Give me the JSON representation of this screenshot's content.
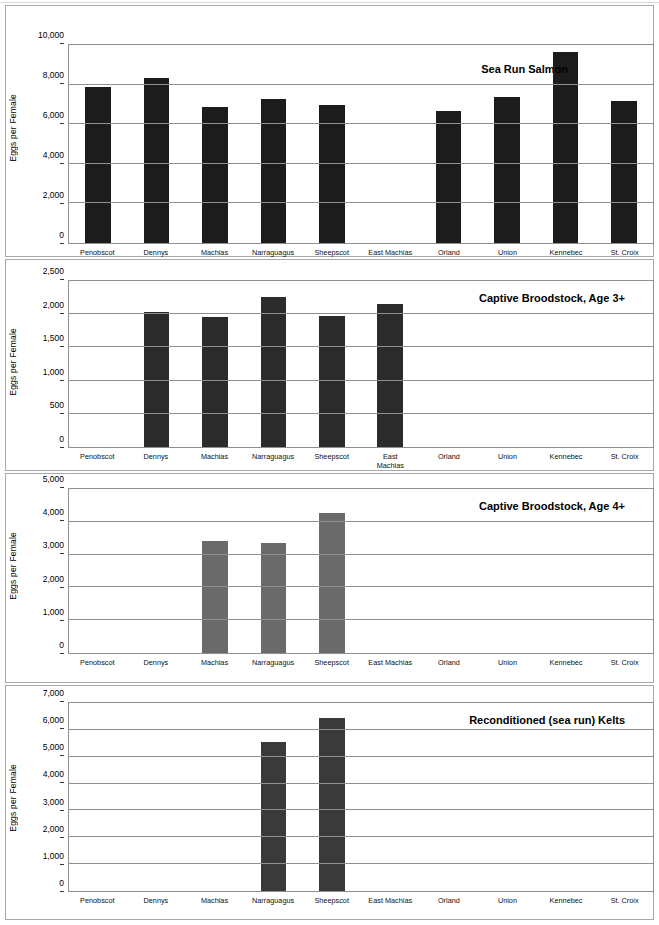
{
  "figure": {
    "title_line1": "Figure 11. Number of eggs per female Atlantic salmon",
    "title_line2": "from Maine rivers by egg source."
  },
  "axis": {
    "ylabel": "Eggs per Female"
  },
  "colors": {
    "bar_sea_run": "#1c1c1c",
    "bar_age3": "#2b2b2b",
    "bar_age4": "#6a6a6a",
    "bar_kelts": "#3a3a3a",
    "gridline": "#8f8f8f",
    "panel_border": "#a8a8a8"
  },
  "chart_data": [
    {
      "type": "bar",
      "title": "Sea Run Salmon",
      "xlabel": "",
      "ylabel": "Eggs per Female",
      "ylim": [
        0,
        10000
      ],
      "yticks": [
        0,
        2000,
        4000,
        6000,
        8000,
        10000
      ],
      "ytick_labels": [
        "0",
        "2,000",
        "4,000",
        "6,000",
        "8,000",
        "10,000"
      ],
      "grid": true,
      "legend": "none",
      "categories": [
        "Penobscot",
        "Dennys",
        "Machias",
        "Narraguagus",
        "Sheepscot",
        "East Machias",
        "Orland",
        "Union",
        "Kennebec",
        "St. Croix"
      ],
      "values": [
        7900,
        8350,
        6880,
        7250,
        6950,
        0,
        6650,
        7380,
        9640,
        7150
      ]
    },
    {
      "type": "bar",
      "title": "Captive Broodstock, Age 3+",
      "xlabel": "",
      "ylabel": "Eggs per Female",
      "ylim": [
        0,
        2500
      ],
      "yticks": [
        0,
        500,
        1000,
        1500,
        2000,
        2500
      ],
      "ytick_labels": [
        "0",
        "500",
        "1,000",
        "1,500",
        "2,000",
        "2,500"
      ],
      "grid": true,
      "legend": "none",
      "categories": [
        "Penobscot",
        "Dennys",
        "Machias",
        "Narraguagus",
        "Sheepscot",
        "East\nMachias",
        "Orland",
        "Union",
        "Kennebec",
        "St. Croix"
      ],
      "values": [
        0,
        2040,
        1965,
        2265,
        1980,
        2155,
        0,
        0,
        0,
        0
      ]
    },
    {
      "type": "bar",
      "title": "Captive Broodstock, Age 4+",
      "xlabel": "",
      "ylabel": "Eggs per Female",
      "ylim": [
        0,
        5000
      ],
      "yticks": [
        0,
        1000,
        2000,
        3000,
        4000,
        5000
      ],
      "ytick_labels": [
        "0",
        "1,000",
        "2,000",
        "3,000",
        "4,000",
        "5,000"
      ],
      "grid": true,
      "legend": "none",
      "categories": [
        "Penobscot",
        "Dennys",
        "Machias",
        "Narraguagus",
        "Sheepscot",
        "East Machias",
        "Orland",
        "Union",
        "Kennebec",
        "St. Croix"
      ],
      "values": [
        0,
        0,
        3420,
        3350,
        4280,
        0,
        0,
        0,
        0,
        0
      ]
    },
    {
      "type": "bar",
      "title": "Reconditioned (sea run) Kelts",
      "xlabel": "",
      "ylabel": "Eggs per Female",
      "ylim": [
        0,
        7000
      ],
      "yticks": [
        0,
        1000,
        2000,
        3000,
        4000,
        5000,
        6000,
        7000
      ],
      "ytick_labels": [
        "0",
        "1,000",
        "2,000",
        "3,000",
        "4,000",
        "5,000",
        "6,000",
        "7,000"
      ],
      "grid": true,
      "legend": "none",
      "categories": [
        "Penobscot",
        "Dennys",
        "Machias",
        "Narraguagus",
        "Sheepscot",
        "East Machias",
        "Orland",
        "Union",
        "Kennebec",
        "St. Croix"
      ],
      "values": [
        0,
        0,
        0,
        5540,
        6440,
        0,
        0,
        0,
        0,
        0
      ]
    }
  ]
}
